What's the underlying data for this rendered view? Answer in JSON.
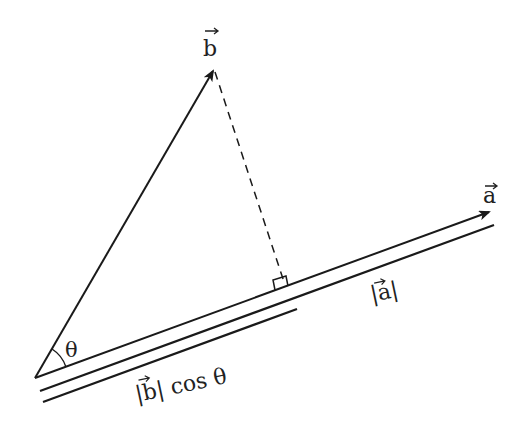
{
  "diagram": {
    "labels": {
      "vec_b": "b",
      "vec_a": "a",
      "theta": "θ",
      "mag_a": "|a|",
      "proj": "|b| cos θ",
      "proj_abs_b": "b",
      "proj_cos": "cos θ"
    },
    "colors": {
      "stroke": "#1a1a1a",
      "text": "#222222",
      "background": "#ffffff"
    },
    "points": {
      "origin": [
        35,
        378
      ],
      "b_tip": [
        215,
        68
      ],
      "a_tip": [
        491,
        211
      ],
      "foot": [
        285,
        287
      ]
    }
  }
}
